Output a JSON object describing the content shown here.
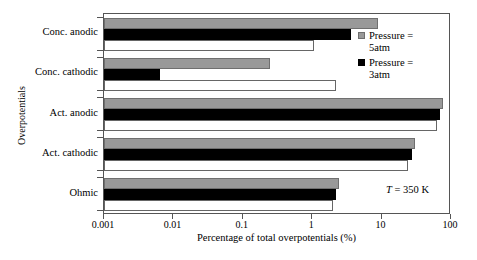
{
  "chart_data": {
    "type": "bar",
    "orientation": "horizontal",
    "title": "",
    "xlabel": "Percentage of total overpotentials (%)",
    "ylabel": "Overpotentials",
    "xscale": "log",
    "xlim": [
      0.001,
      100
    ],
    "xticks": [
      0.001,
      0.01,
      0.1,
      1,
      10,
      100
    ],
    "xticklabels": [
      "0.001",
      "0.01",
      "0.1",
      "1",
      "10",
      "100"
    ],
    "grid": false,
    "legend_position": "upper right",
    "categories": [
      "Conc. anodic",
      "Conc. cathodic",
      "Act. anodic",
      "Act. cathodic",
      "Ohmic"
    ],
    "series": [
      {
        "name": "Pressure = 5atm",
        "color": "#999999",
        "values": [
          8.9,
          0.25,
          77,
          30,
          2.4
        ]
      },
      {
        "name": "Pressure = 3atm",
        "color": "#000000",
        "values": [
          3.6,
          0.0064,
          70,
          27,
          2.2
        ]
      },
      {
        "name": "",
        "color": "#ffffff",
        "values": [
          1.05,
          2.2,
          62,
          24,
          2.0
        ]
      }
    ],
    "annotations": [
      {
        "text_italic": "T",
        "text": " = 350 K"
      }
    ]
  },
  "legend": {
    "entries": [
      {
        "label_line1": "Pressure =",
        "label_line2": "5atm",
        "swatch": "gray-square-swatch"
      },
      {
        "label_line1": "Pressure =",
        "label_line2": "3atm",
        "swatch": "black-square-swatch"
      }
    ]
  },
  "annotation": {
    "symbol": "T",
    "value": " = 350 K"
  },
  "axes": {
    "x_title": "Percentage of total overpotentials (%)",
    "y_title": "Overpotentials",
    "x_tick_labels": [
      "0.001",
      "0.01",
      "0.1",
      "1",
      "10",
      "100"
    ],
    "y_tick_labels": [
      "Conc. anodic",
      "Conc. cathodic",
      "Act. anodic",
      "Act. cathodic",
      "Ohmic"
    ]
  }
}
